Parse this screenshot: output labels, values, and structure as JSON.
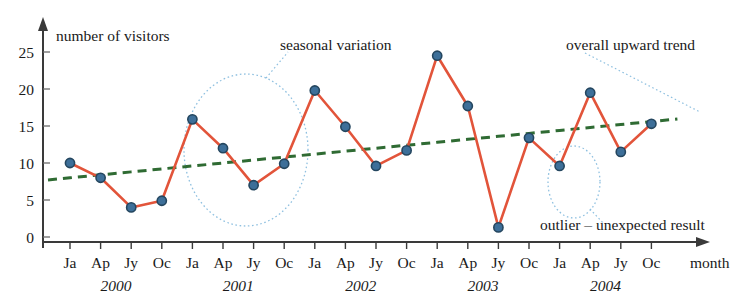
{
  "chart_data": {
    "type": "line",
    "title": "",
    "ylabel": "number of visitors",
    "xlabel": "month",
    "ylim": [
      0,
      27
    ],
    "yticks": [
      0,
      5,
      10,
      15,
      20,
      25
    ],
    "grid": false,
    "legend_position": "none",
    "categories": [
      "Ja",
      "Ap",
      "Jy",
      "Oc",
      "Ja",
      "Ap",
      "Jy",
      "Oc",
      "Ja",
      "Ap",
      "Jy",
      "Oc",
      "Ja",
      "Ap",
      "Jy",
      "Oc",
      "Ja",
      "Ap",
      "Jy",
      "Oc"
    ],
    "year_groups": [
      {
        "label": "2000",
        "start_index": 0,
        "span": 4
      },
      {
        "label": "2001",
        "start_index": 4,
        "span": 4
      },
      {
        "label": "2002",
        "start_index": 8,
        "span": 4
      },
      {
        "label": "2003",
        "start_index": 12,
        "span": 4
      },
      {
        "label": "2004",
        "start_index": 16,
        "span": 4
      }
    ],
    "series": [
      {
        "name": "number of visitors",
        "color": "#e2543a",
        "marker_color": "#3d6f99",
        "values": [
          10.0,
          8.0,
          4.0,
          4.9,
          15.9,
          12.0,
          7.0,
          9.9,
          19.8,
          14.9,
          9.6,
          11.7,
          24.5,
          17.7,
          1.3,
          13.4,
          9.6,
          19.5,
          11.5,
          15.3
        ]
      },
      {
        "name": "overall upward trend",
        "color": "#2f6b33",
        "style": "dashed",
        "values": [
          8.0,
          8.4,
          8.8,
          9.2,
          9.6,
          10.0,
          10.4,
          10.8,
          11.2,
          11.6,
          12.0,
          12.4,
          12.8,
          13.2,
          13.6,
          14.0,
          14.4,
          14.8,
          15.2,
          15.6
        ]
      }
    ],
    "annotations": [
      {
        "name": "seasonal-variation",
        "text": "seasonal variation"
      },
      {
        "name": "overall-upward-trend",
        "text": "overall upward trend"
      },
      {
        "name": "outlier",
        "text": "outlier – unexpected result"
      }
    ]
  },
  "axes": {
    "y_title": "number of visitors",
    "x_title": "month",
    "y_tick_labels": [
      "25",
      "20",
      "15",
      "10",
      "5",
      "0"
    ]
  },
  "colors": {
    "data_line": "#e2543a",
    "marker": "#3d6f99",
    "trend_line": "#2f6b33",
    "annotation_circle": "#8fc0e0",
    "axis": "#3a3a3a"
  }
}
